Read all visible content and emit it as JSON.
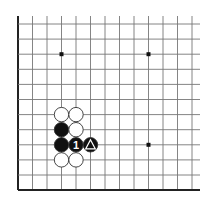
{
  "diagram": {
    "type": "go-board-fragment",
    "edges_shown": [
      "left",
      "bottom"
    ],
    "grid": {
      "columns": 13,
      "rows": 12,
      "origin_x": 18,
      "origin_y": 24,
      "spacing_x": 14.5,
      "spacing_y": 15.1,
      "extend_right": 8,
      "extend_top": 8
    },
    "colors": {
      "line": "#777777",
      "edge": "#222222",
      "black_stone": "#111111",
      "white_stone": "#ffffff",
      "stone_outline": "#333333",
      "marker_on_black": "#ffffff"
    },
    "star_points": [
      {
        "col": 3,
        "row": 2
      },
      {
        "col": 9,
        "row": 2
      },
      {
        "col": 9,
        "row": 8
      }
    ],
    "stones": [
      {
        "col": 3,
        "row": 6,
        "color": "white"
      },
      {
        "col": 4,
        "row": 6,
        "color": "white"
      },
      {
        "col": 3,
        "row": 7,
        "color": "black"
      },
      {
        "col": 4,
        "row": 7,
        "color": "white"
      },
      {
        "col": 3,
        "row": 8,
        "color": "black"
      },
      {
        "col": 4,
        "row": 8,
        "color": "black",
        "label": "1"
      },
      {
        "col": 5,
        "row": 8,
        "color": "black",
        "marker": "triangle"
      },
      {
        "col": 3,
        "row": 9,
        "color": "white"
      },
      {
        "col": 4,
        "row": 9,
        "color": "white"
      }
    ]
  }
}
